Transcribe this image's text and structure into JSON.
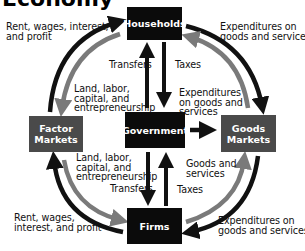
{
  "diagram": {
    "title_partial": "Economy",
    "nodes": {
      "households": "Households",
      "government": "Government",
      "firms": "Firms",
      "factor_markets_line1": "Factor",
      "factor_markets_line2": "Markets",
      "goods_markets_line1": "Goods",
      "goods_markets_line2": "Markets"
    },
    "labels": {
      "top_left_1": "Rent, wages, interest,",
      "top_left_2": "and profit",
      "top_right_1": "Expenditures on",
      "top_right_2": "goods and services",
      "upper_inner_left_1": "Land, labor,",
      "upper_inner_left_2": "capital, and",
      "upper_inner_left_3": "entrepreneurship",
      "upper_transfers": "Transfers",
      "upper_taxes": "Taxes",
      "gov_exp_1": "Expenditures",
      "gov_exp_2": "on goods and",
      "gov_exp_3": "services",
      "lower_inner_left_1": "Land, labor,",
      "lower_inner_left_2": "capital, and",
      "lower_inner_left_3": "entrepreneurship",
      "lower_transfers": "Transfers",
      "lower_goods_1": "Goods and",
      "lower_goods_2": "services",
      "lower_taxes": "Taxes",
      "bottom_left_1": "Rent, wages,",
      "bottom_left_2": "interest, and profit",
      "bottom_right_1": "Expenditures on",
      "bottom_right_2": "goods and services"
    },
    "colors": {
      "primary_box": "#0b0b0b",
      "market_box": "#4a4a4a",
      "outer_arrow": "#111111",
      "inner_arrow": "#7a7a7a"
    }
  }
}
